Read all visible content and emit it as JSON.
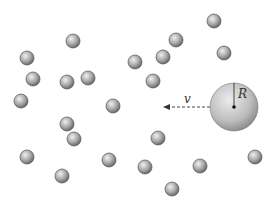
{
  "diagram": {
    "big_sphere": {
      "radius_label": "R"
    },
    "velocity": {
      "label": "v",
      "direction": "left"
    },
    "small_particle_count": 23,
    "colors": {
      "background": "#ffffff",
      "sphere_light": "#e6e6e6",
      "sphere_dark": "#6e6e6e",
      "outline": "#555555",
      "arrow": "#333333"
    }
  }
}
